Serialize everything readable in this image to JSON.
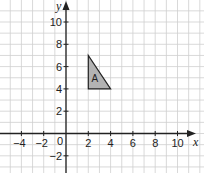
{
  "chart_data": {
    "type": "scatter",
    "title": "",
    "xlabel": "x",
    "ylabel": "y",
    "xlim": [
      -6,
      12
    ],
    "ylim": [
      -3.5,
      12
    ],
    "grid": true,
    "grid_step": 1,
    "x_ticks": [
      -4,
      -2,
      2,
      4,
      6,
      8,
      10
    ],
    "x_tick_labels": [
      "−4",
      "−2",
      "2",
      "4",
      "6",
      "8",
      "10"
    ],
    "y_ticks": [
      10,
      8,
      6,
      4,
      2,
      -2
    ],
    "y_tick_labels": [
      "10",
      "8",
      "6",
      "4",
      "2",
      "−2"
    ],
    "origin_label": "0",
    "shapes": [
      {
        "name": "A",
        "kind": "triangle",
        "vertices": [
          [
            2,
            7
          ],
          [
            2,
            4
          ],
          [
            4,
            4
          ]
        ],
        "fill": "#b3b3b3",
        "stroke": "#222222"
      }
    ],
    "colors": {
      "grid": "#cfcfcf",
      "axis": "#222222"
    }
  }
}
